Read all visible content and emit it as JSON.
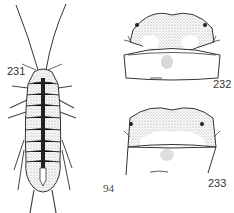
{
  "figures": [
    {
      "id": "231",
      "label": "231",
      "subject": "whole-insect-dorsal-view"
    },
    {
      "id": "232",
      "label": "232",
      "subject": "head-pronotum-detail-a"
    },
    {
      "id": "233",
      "label": "233",
      "subject": "head-pronotum-detail-b"
    }
  ],
  "page_number": "94",
  "colors": {
    "ink": "#222222",
    "stipple": "#9a9a9a",
    "background": "#ffffff"
  }
}
